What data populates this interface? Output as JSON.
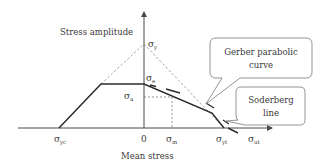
{
  "diagram": {
    "y_axis_label": "Stress amplitude",
    "x_axis_label": "Mean stress",
    "origin_label": "0",
    "sigma": "σ",
    "points": {
      "sigma_y": {
        "sub": "y"
      },
      "sigma_e": {
        "sub": "e"
      },
      "sigma_a": {
        "sub": "a"
      },
      "sigma_m": {
        "sub": "m"
      },
      "sigma_yc": {
        "sub": "yc"
      },
      "sigma_yt": {
        "sub": "yt"
      },
      "sigma_ut": {
        "sub": "ut"
      }
    },
    "callouts": {
      "gerber": {
        "line1": "Gerber parabolic",
        "line2": "curve"
      },
      "soderberg": {
        "line1": "Soderberg",
        "line2": "line"
      }
    },
    "colors": {
      "solid_line": "#2b2b2b",
      "dashed_line": "#8a8a8a",
      "axis": "#4a4a4a",
      "text": "#3a3a3a"
    }
  }
}
